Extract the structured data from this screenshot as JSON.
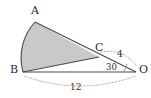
{
  "figure": {
    "type": "geometry-diagram",
    "background_color": "#ffffff",
    "sector_fill_color": "#c9c9c9",
    "stroke_color": "#4a4a4a",
    "dotted_color": "#a0a0a0",
    "vertices": [
      {
        "name": "A",
        "label": "A",
        "x": 35,
        "y": 22,
        "label_x": 31,
        "label_y": 5
      },
      {
        "name": "B",
        "label": "B",
        "x": 23,
        "y": 72,
        "label_x": 10,
        "label_y": 64
      },
      {
        "name": "C",
        "label": "C",
        "x": 99,
        "y": 57,
        "label_x": 95,
        "label_y": 42
      },
      {
        "name": "O",
        "label": "O",
        "x": 136,
        "y": 72,
        "label_x": 139,
        "label_y": 64
      }
    ],
    "measures": {
      "segment_CO": "4",
      "segment_BO": "12",
      "angle_at_O": "30"
    },
    "labels": {
      "co_length": {
        "text": "4",
        "x": 117,
        "y": 50
      },
      "bo_length": {
        "text": "12",
        "x": 70,
        "y": 83
      },
      "angle_o": {
        "text": "30",
        "x": 106,
        "y": 63
      }
    }
  }
}
